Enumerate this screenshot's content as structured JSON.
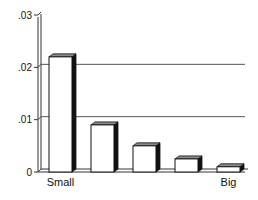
{
  "chart_data": {
    "type": "bar",
    "title": "",
    "xlabel": "",
    "ylabel": "",
    "categories": [
      "Small",
      "",
      "",
      "",
      "Big"
    ],
    "values": [
      0.022,
      0.009,
      0.005,
      0.0025,
      0.001
    ],
    "ylim": [
      0,
      0.03
    ],
    "yticks": [
      0,
      0.01,
      0.02,
      0.03
    ],
    "ytick_labels": [
      "0",
      ".01",
      ".02",
      ".03"
    ],
    "x_endpoint_labels": {
      "left": "Small",
      "right": "Big"
    },
    "grid": true,
    "gridlines_at": [
      0.01,
      0.02
    ],
    "style": "3d-bar",
    "legend": null
  },
  "colors": {
    "bar_face": "#ffffff",
    "bar_side": "#111111",
    "bar_top": "#8a8a8a",
    "axis": "#333333",
    "grid": "#555555"
  }
}
